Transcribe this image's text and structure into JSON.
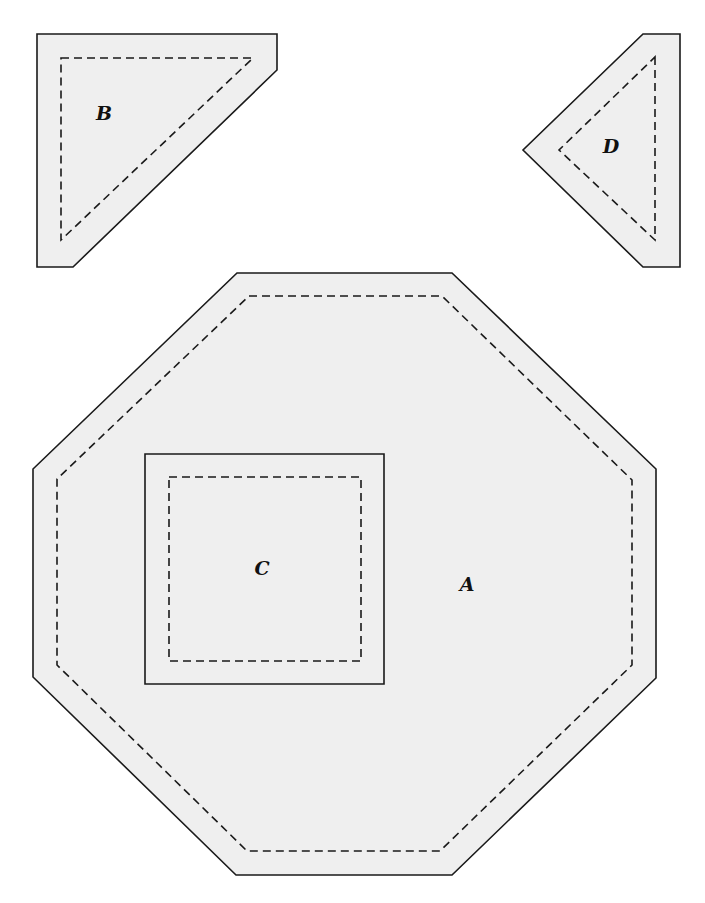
{
  "diagram": {
    "type": "quilt-template-pieces",
    "colors": {
      "fill": "#efefef",
      "stroke": "#1a1a1a",
      "background": "#ffffff"
    },
    "pieces": [
      {
        "id": "A",
        "label": "A",
        "shape": "octagon",
        "cut_line": "237,273 452,273 656,469 656,678 452,875 236,875 33,677 33,469",
        "seam_line": "249,296 442,296 632,480 632,665 440,851 247,851 57,665 57,479",
        "label_pos": [
          467,
          591
        ]
      },
      {
        "id": "B",
        "label": "B",
        "shape": "truncated-triangle",
        "cut_line": "37,34 277,34 277,70 73,267 37,267",
        "seam_line": "61,58 253,58 61,240",
        "label_pos": [
          104,
          120
        ]
      },
      {
        "id": "C",
        "label": "C",
        "shape": "square",
        "cut_line": "145,454 384,454 384,684 145,684",
        "seam_line": "169,477 361,477 361,661 169,661",
        "label_pos": [
          262,
          575
        ]
      },
      {
        "id": "D",
        "label": "D",
        "shape": "truncated-triangle",
        "cut_line": "643,34 680,34 680,267 643,267 523,150",
        "seam_line": "655,57 655,240 559,150",
        "label_pos": [
          611,
          153
        ]
      }
    ],
    "legend": {
      "solid_line": "cutting line",
      "dashed_line": "seam line"
    }
  }
}
